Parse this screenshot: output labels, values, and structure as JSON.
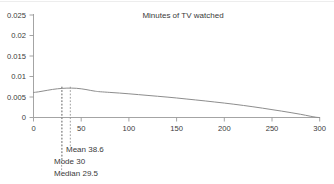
{
  "chart_data": {
    "type": "line",
    "title": "Minutes of TV watched",
    "xlabel": "",
    "ylabel": "",
    "xlim": [
      0,
      300
    ],
    "ylim": [
      0,
      0.025
    ],
    "grid": false,
    "legend": null,
    "x_ticks": [
      0,
      50,
      100,
      150,
      200,
      250,
      300
    ],
    "x_tick_labels": [
      "0",
      "50",
      "100",
      "150",
      "200",
      "250",
      "300"
    ],
    "y_ticks": [
      0,
      0.005,
      0.01,
      0.015,
      0.02,
      0.025
    ],
    "y_tick_labels": [
      "0",
      "0.005",
      "0.01",
      "0.015",
      "0.02",
      "0.025"
    ],
    "series": [
      {
        "name": "density",
        "x": [
          0,
          5,
          10,
          15,
          20,
          25,
          30,
          35,
          40,
          45,
          50,
          55,
          60,
          65,
          70,
          80,
          90,
          100,
          110,
          120,
          130,
          140,
          150,
          160,
          170,
          180,
          190,
          200,
          210,
          220,
          230,
          240,
          250,
          260,
          270,
          280,
          290,
          297,
          300
        ],
        "y": [
          0.0061,
          0.00625,
          0.00645,
          0.00665,
          0.00685,
          0.007,
          0.0071,
          0.00716,
          0.00717,
          0.00712,
          0.007,
          0.00682,
          0.0066,
          0.0064,
          0.00628,
          0.00612,
          0.00596,
          0.00578,
          0.00558,
          0.00538,
          0.00518,
          0.00498,
          0.00476,
          0.00452,
          0.00428,
          0.00404,
          0.00378,
          0.00352,
          0.00324,
          0.00294,
          0.00262,
          0.00228,
          0.00192,
          0.00156,
          0.00118,
          0.00078,
          0.00032,
          4e-05,
          0.0
        ]
      }
    ],
    "annotations": [
      {
        "name": "median",
        "label": "Median 29.5",
        "x_value": 29.5
      },
      {
        "name": "mode",
        "label": "Mode 30",
        "x_value": 30
      },
      {
        "name": "mean",
        "label": "Mean 38.6",
        "x_value": 38.6
      }
    ],
    "colors": {
      "curve": "#8d8d8d",
      "axis": "#9a9a9a",
      "text": "#3a3a3a",
      "marker": "#8d8d8d",
      "background": "#ffffff"
    }
  }
}
